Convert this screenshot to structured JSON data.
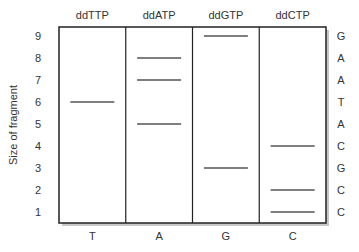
{
  "diagram": {
    "y_axis_label": "Size of fragment",
    "sizes": [
      "1",
      "2",
      "3",
      "4",
      "5",
      "6",
      "7",
      "8",
      "9"
    ],
    "lanes": [
      {
        "header": "ddTTP",
        "base": "T",
        "bands": [
          6
        ]
      },
      {
        "header": "ddATP",
        "base": "A",
        "bands": [
          5,
          7,
          8
        ]
      },
      {
        "header": "ddGTP",
        "base": "G",
        "bands": [
          3,
          9
        ]
      },
      {
        "header": "ddCTP",
        "base": "C",
        "bands": [
          1,
          2,
          4
        ]
      }
    ],
    "read_sequence": [
      {
        "size": 9,
        "base": "G"
      },
      {
        "size": 8,
        "base": "A"
      },
      {
        "size": 7,
        "base": "A"
      },
      {
        "size": 6,
        "base": "T"
      },
      {
        "size": 5,
        "base": "A"
      },
      {
        "size": 4,
        "base": "C"
      },
      {
        "size": 3,
        "base": "G"
      },
      {
        "size": 2,
        "base": "C"
      },
      {
        "size": 1,
        "base": "C"
      }
    ],
    "colors": {
      "frame": "#222222",
      "band": "#555555",
      "shadow": "#c8c8c8",
      "text": "#333333"
    }
  }
}
